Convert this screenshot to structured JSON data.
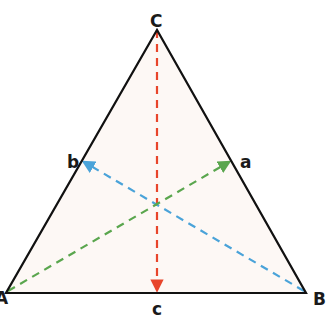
{
  "diagram": {
    "type": "triangle-medians",
    "vertices": {
      "A": {
        "label": "A",
        "x": 6,
        "y": 293
      },
      "B": {
        "label": "B",
        "x": 306,
        "y": 293
      },
      "C": {
        "label": "C",
        "x": 157,
        "y": 30
      }
    },
    "midpoints": {
      "a": {
        "label": "a",
        "x": 231,
        "y": 161
      },
      "b": {
        "label": "b",
        "x": 82,
        "y": 161
      },
      "c": {
        "label": "c",
        "x": 157,
        "y": 293
      }
    },
    "medians": [
      {
        "from": "A",
        "to": "a",
        "color": "#5aa64e"
      },
      {
        "from": "B",
        "to": "b",
        "color": "#4aa3d9"
      },
      {
        "from": "C",
        "to": "c",
        "color": "#e8452b"
      }
    ],
    "colors": {
      "edge": "#111111",
      "fill": "#fdf8f5"
    }
  }
}
